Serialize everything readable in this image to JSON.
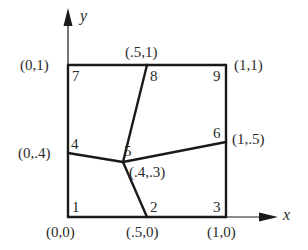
{
  "diagram": {
    "title": "",
    "axes": {
      "x_label": "x",
      "y_label": "y"
    },
    "nodes": [
      {
        "id": "1",
        "label": "1",
        "coord_label": "(0,0)",
        "x": 0,
        "y": 0
      },
      {
        "id": "2",
        "label": "2",
        "coord_label": "(.5,0)",
        "x": 0.5,
        "y": 0
      },
      {
        "id": "3",
        "label": "3",
        "coord_label": "(1,0)",
        "x": 1,
        "y": 0
      },
      {
        "id": "4",
        "label": "4",
        "coord_label": "(0,.4)",
        "x": 0,
        "y": 0.4
      },
      {
        "id": "5",
        "label": "5",
        "coord_label": "(.4,.3)",
        "x": 0.4,
        "y": 0.3
      },
      {
        "id": "6",
        "label": "6",
        "coord_label": "(1,.5)",
        "x": 1,
        "y": 0.5
      },
      {
        "id": "7",
        "label": "7",
        "coord_label": "(0,1)",
        "x": 0,
        "y": 1
      },
      {
        "id": "8",
        "label": "8",
        "coord_label": "(.5,1)",
        "x": 0.5,
        "y": 1
      },
      {
        "id": "9",
        "label": "9",
        "coord_label": "(1,1)",
        "x": 1,
        "y": 1
      }
    ],
    "edges": [
      [
        "1",
        "2"
      ],
      [
        "2",
        "3"
      ],
      [
        "3",
        "6"
      ],
      [
        "6",
        "9"
      ],
      [
        "9",
        "8"
      ],
      [
        "8",
        "7"
      ],
      [
        "7",
        "4"
      ],
      [
        "4",
        "1"
      ],
      [
        "4",
        "5"
      ],
      [
        "5",
        "6"
      ],
      [
        "2",
        "5"
      ],
      [
        "5",
        "8"
      ]
    ],
    "colors": {
      "stroke": "#1a1a1a",
      "background": "#ffffff"
    }
  }
}
